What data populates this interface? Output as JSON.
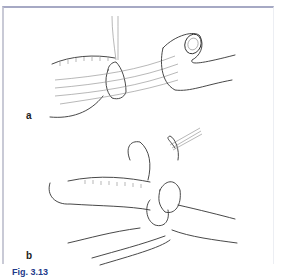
{
  "figure": {
    "panels": [
      {
        "label": "a"
      },
      {
        "label": "b"
      }
    ],
    "caption": {
      "number": "Fig. 3.13",
      "text": "(caption text clipped at image bottom)"
    }
  }
}
